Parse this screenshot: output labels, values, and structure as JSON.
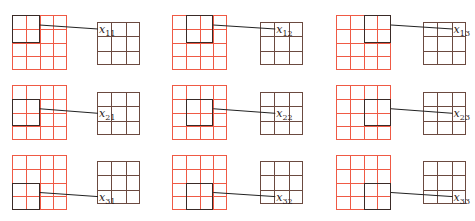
{
  "diagram": {
    "title": "",
    "colors": {
      "input_grid": "#ef5a45",
      "output_grid": "#6b4a40",
      "window_frame": "#3a2a26",
      "arrow": "#222222"
    },
    "input_grid_size": 4,
    "output_grid_size": 3,
    "window_size": 2,
    "panels": [
      {
        "row": 1,
        "col": 1,
        "label_var": "x",
        "label_sub": "11"
      },
      {
        "row": 1,
        "col": 2,
        "label_var": "x",
        "label_sub": "12"
      },
      {
        "row": 1,
        "col": 3,
        "label_var": "x",
        "label_sub": "13"
      },
      {
        "row": 2,
        "col": 1,
        "label_var": "x",
        "label_sub": "21"
      },
      {
        "row": 2,
        "col": 2,
        "label_var": "x",
        "label_sub": "22"
      },
      {
        "row": 2,
        "col": 3,
        "label_var": "x",
        "label_sub": "23"
      },
      {
        "row": 3,
        "col": 1,
        "label_var": "x",
        "label_sub": "31"
      },
      {
        "row": 3,
        "col": 2,
        "label_var": "x",
        "label_sub": "32"
      },
      {
        "row": 3,
        "col": 3,
        "label_var": "x",
        "label_sub": "33"
      }
    ]
  }
}
